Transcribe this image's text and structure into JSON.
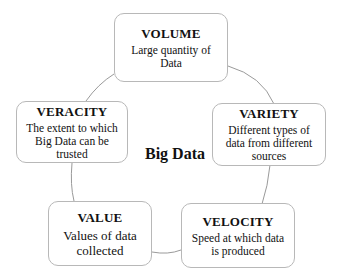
{
  "diagram": {
    "center": "Big Data",
    "nodes": [
      {
        "id": "volume",
        "title": "VOLUME",
        "description": "Large quantity of Data"
      },
      {
        "id": "variety",
        "title": "VARIETY",
        "description": "Different types of data from different sources"
      },
      {
        "id": "velocity",
        "title": "VELOCITY",
        "description": "Speed at which data is produced"
      },
      {
        "id": "value",
        "title": "VALUE",
        "description": "Values of data collected"
      },
      {
        "id": "veracity",
        "title": "VERACITY",
        "description": "The extent to which Big Data can be trusted"
      }
    ],
    "colors": {
      "border": "#b8b8b8",
      "connector": "#9a9a9a",
      "text": "#111111",
      "background": "#ffffff"
    }
  }
}
